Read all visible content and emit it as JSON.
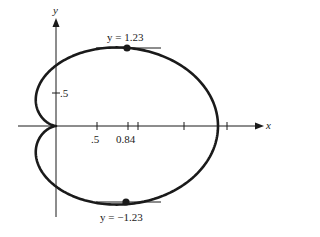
{
  "figure": {
    "type": "polar-curve-plot"
  },
  "axes": {
    "x_label": "x",
    "y_label": "y",
    "x_ticks": [
      {
        "value": 0.5,
        "label": ".5"
      },
      {
        "value": 0.84,
        "label": "0.84"
      },
      {
        "value": 1.0,
        "label": ""
      },
      {
        "value": 1.5,
        "label": ""
      },
      {
        "value": 2.0,
        "label": ""
      }
    ],
    "y_ticks": [
      {
        "value": 0.5,
        "label": ".5"
      }
    ]
  },
  "annotations": {
    "top_point": {
      "x": 0.84,
      "y": 1.23,
      "label": "y = 1.23"
    },
    "bottom_point": {
      "x": 0.84,
      "y": -1.23,
      "label": "y = −1.23"
    }
  },
  "colors": {
    "ink": "#1a1a1a",
    "background": "#ffffff"
  }
}
